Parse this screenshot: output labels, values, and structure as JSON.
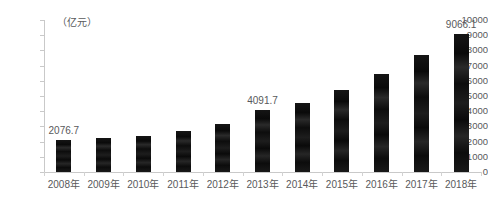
{
  "chart_data": {
    "type": "bar",
    "title": "",
    "subtitle": "",
    "unit_label": "（亿元）",
    "xlabel": "",
    "ylabel": "",
    "categories": [
      "2008年",
      "2009年",
      "2010年",
      "2011年",
      "2012年",
      "2013年",
      "2014年",
      "2015年",
      "2016年",
      "2017年",
      "2018年"
    ],
    "values": [
      2076.7,
      2240.0,
      2370.0,
      2720.0,
      3130.0,
      4091.7,
      4550.0,
      5400.0,
      6480.0,
      7680.0,
      9066.1
    ],
    "point_labels": [
      "2076.7",
      "",
      "",
      "",
      "",
      "4091.7",
      "",
      "",
      "",
      "",
      "9066.1"
    ],
    "ylim": [
      0,
      10000
    ],
    "ytick_labels": [
      "0",
      "1000",
      "2000",
      "3000",
      "4000",
      "5000",
      "6000",
      "7000",
      "8000",
      "9000",
      "10000"
    ],
    "ytick_values": [
      0,
      1000,
      2000,
      3000,
      4000,
      5000,
      6000,
      7000,
      8000,
      9000,
      10000
    ],
    "grid": false,
    "legend": null,
    "series_color": "#111111",
    "axis_color": "#c9c9c9",
    "text_color": "#58595b",
    "background": "#ffffff"
  }
}
